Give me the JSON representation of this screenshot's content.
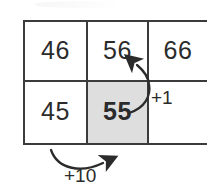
{
  "diagram": {
    "colors": {
      "grid_line": "#3b3b3b",
      "text": "#2b2b2b",
      "highlight_cell_fill": "#dedede",
      "arrow": "#2b2b2b",
      "background": "#ffffff"
    },
    "grid": {
      "rows": 2,
      "columns": 3,
      "cells": [
        {
          "value": "46",
          "row": 1,
          "column": 1,
          "bold": false,
          "shaded": false
        },
        {
          "value": "56",
          "row": 1,
          "column": 2,
          "bold": false,
          "shaded": false
        },
        {
          "value": "66",
          "row": 1,
          "column": 3,
          "bold": false,
          "shaded": false
        },
        {
          "value": "45",
          "row": 2,
          "column": 1,
          "bold": false,
          "shaded": false
        },
        {
          "value": "55",
          "row": 2,
          "column": 2,
          "bold": true,
          "shaded": true
        },
        {
          "value": "",
          "row": 2,
          "column": 3,
          "bold": false,
          "shaded": false
        }
      ]
    },
    "annotations": [
      {
        "id": "plus-one",
        "label": "+1",
        "from_cell": "55",
        "to_cell": "56",
        "direction": "up"
      },
      {
        "id": "plus-ten",
        "label": "+10",
        "from_cell": "45",
        "to_cell": "55",
        "direction": "right"
      }
    ]
  }
}
